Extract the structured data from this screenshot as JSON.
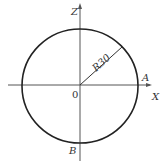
{
  "diagram": {
    "type": "circle-on-axes",
    "colors": {
      "background": "#ffffff",
      "stroke": "#222222",
      "axis": "#555555",
      "text": "#333333"
    },
    "axes": {
      "horizontal_label": "X",
      "vertical_label": "Z",
      "origin_label": "0"
    },
    "circle": {
      "radius_label": "R30"
    },
    "points": {
      "A": "A",
      "B": "B"
    }
  }
}
